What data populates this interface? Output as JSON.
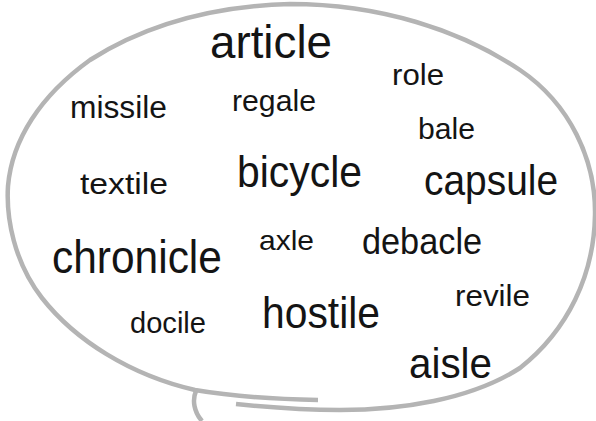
{
  "figure": {
    "type": "word-cloud-speech-bubble",
    "bubble": {
      "stroke_color": "#b4b4b4",
      "fill_color": "#ffffff"
    },
    "text_color": "#141414",
    "words": [
      {
        "text": "article",
        "left": 210,
        "top": 19,
        "size": 46,
        "width": 122
      },
      {
        "text": "missile",
        "left": 70,
        "top": 92,
        "size": 31,
        "width": 97
      },
      {
        "text": "regale",
        "left": 232,
        "top": 86,
        "size": 30,
        "width": 84
      },
      {
        "text": "role",
        "left": 392,
        "top": 61,
        "size": 29,
        "width": 52
      },
      {
        "text": "bale",
        "left": 418,
        "top": 115,
        "size": 29,
        "width": 57
      },
      {
        "text": "textile",
        "left": 80,
        "top": 170,
        "size": 29,
        "width": 88
      },
      {
        "text": "bicycle",
        "left": 237,
        "top": 150,
        "size": 44,
        "width": 125
      },
      {
        "text": "capsule",
        "left": 424,
        "top": 160,
        "size": 42,
        "width": 134
      },
      {
        "text": "chronicle",
        "left": 52,
        "top": 234,
        "size": 46,
        "width": 170
      },
      {
        "text": "axle",
        "left": 259,
        "top": 227,
        "size": 28,
        "width": 55
      },
      {
        "text": "debacle",
        "left": 362,
        "top": 224,
        "size": 36,
        "width": 120
      },
      {
        "text": "revile",
        "left": 455,
        "top": 282,
        "size": 29,
        "width": 75
      },
      {
        "text": "docile",
        "left": 130,
        "top": 309,
        "size": 29,
        "width": 76
      },
      {
        "text": "hostile",
        "left": 262,
        "top": 291,
        "size": 44,
        "width": 118
      },
      {
        "text": "aisle",
        "left": 409,
        "top": 343,
        "size": 42,
        "width": 83
      }
    ]
  }
}
